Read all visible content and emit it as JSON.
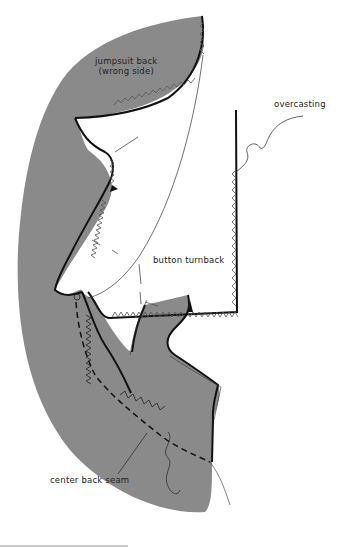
{
  "diagram": {
    "colors": {
      "fabric_wrong_side": "#8a8a8a",
      "outline": "#111111",
      "background": "#ffffff"
    },
    "labels": {
      "jumpsuit_back_line1": "jumpsuit back",
      "jumpsuit_back_line2": "(wrong side)",
      "overcasting": "overcasting",
      "button_turnback": "button turnback",
      "center_back_seam": "center back seam"
    }
  }
}
